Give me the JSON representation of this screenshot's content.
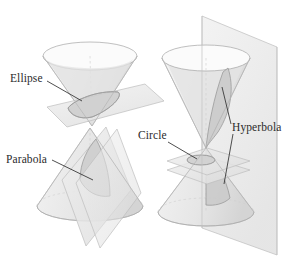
{
  "figure": {
    "background_color": "#ffffff",
    "ink_color": "#2b2b2b",
    "surface_fill": "#e8e8e8",
    "plane_fill": "#ededed",
    "section_fill": "#cfcfcf",
    "outline_color": "#b9b9b9",
    "width": 291,
    "height": 268
  },
  "labels": {
    "ellipse": "Ellipse",
    "parabola": "Parabola",
    "circle": "Circle",
    "hyperbola": "Hyperbola"
  },
  "diagram_items": [
    {
      "name": "ellipse",
      "label": "Ellipse",
      "description": "Inverted cone cut by an oblique plane",
      "label_x": 10,
      "label_y": 82,
      "cone_orientation": "apex-down",
      "plane_orientation": "oblique"
    },
    {
      "name": "parabola",
      "label": "Parabola",
      "description": "Upright cone cut by a plane parallel to a generator",
      "label_x": 6,
      "label_y": 163,
      "cone_orientation": "apex-up",
      "plane_orientation": "slanted-vertical"
    },
    {
      "name": "circle",
      "label": "Circle",
      "description": "Double cone cut by a horizontal plane near the apex",
      "label_x": 138,
      "label_y": 139,
      "cone_orientation": "double",
      "plane_orientation": "horizontal"
    },
    {
      "name": "hyperbola",
      "label": "Hyperbola",
      "description": "Double cone cut by a vertical plane giving two branches",
      "label_x": 232,
      "label_y": 131,
      "cone_orientation": "double",
      "plane_orientation": "vertical"
    }
  ]
}
